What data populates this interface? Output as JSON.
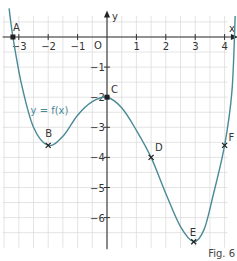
{
  "chart_data": {
    "type": "line",
    "title": "",
    "caption": "Fig. 6",
    "xlabel": "x",
    "ylabel": "y",
    "origin_label": "O",
    "function_label": "y = f(x)",
    "xlim": [
      -3.3,
      4.3
    ],
    "ylim": [
      -7.1,
      0.6
    ],
    "x_ticks": [
      -3,
      -2,
      -1,
      1,
      2,
      3,
      4
    ],
    "y_ticks": [
      -1,
      -2,
      -3,
      -4,
      -5,
      -6
    ],
    "grid": true,
    "grid_step": 0.5,
    "points": [
      {
        "label": "A",
        "x": -3.2,
        "y": 0
      },
      {
        "label": "B",
        "x": -2,
        "y": -3.6
      },
      {
        "label": "C",
        "x": 0,
        "y": -2
      },
      {
        "label": "D",
        "x": 1.5,
        "y": -4
      },
      {
        "label": "E",
        "x": 2.95,
        "y": -6.8
      },
      {
        "label": "F",
        "x": 4,
        "y": -3.6
      }
    ],
    "curve_color": "#4a8a96"
  },
  "figure": {
    "caption": "Fig. 6"
  }
}
